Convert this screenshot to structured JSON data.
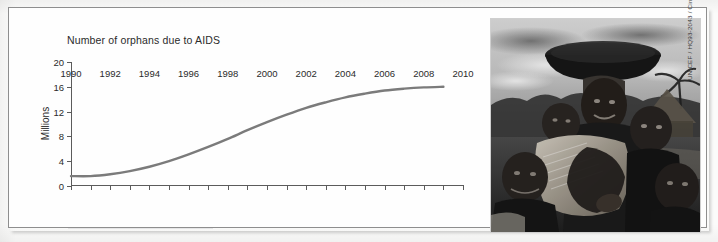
{
  "chart_data": {
    "type": "line",
    "title": "Number of orphans due to AIDS",
    "xlabel": "",
    "ylabel": "Millions",
    "xlim": [
      1990,
      2010
    ],
    "ylim": [
      0,
      20
    ],
    "grid": false,
    "legend": "none",
    "y_ticks": [
      0,
      4,
      8,
      12,
      16,
      20
    ],
    "y_tick_labels": [
      "0",
      "4",
      "8",
      "12",
      "16",
      "20"
    ],
    "x_ticks": [
      1990,
      1992,
      1994,
      1996,
      1998,
      2000,
      2002,
      2004,
      2006,
      2008,
      2010
    ],
    "x_tick_labels": [
      "1990",
      "1992",
      "1994",
      "1996",
      "1998",
      "2000",
      "2002",
      "2004",
      "2006",
      "2008",
      "2010"
    ],
    "x_minor_ticks": [
      1991,
      1993,
      1995,
      1997,
      1999,
      2001,
      2003,
      2005,
      2007,
      2009
    ],
    "series": [
      {
        "name": "Orphans due to AIDS",
        "color": "#7b7b7b",
        "x": [
          1990,
          1991,
          1992,
          1993,
          1994,
          1995,
          1996,
          1997,
          1998,
          1999,
          2000,
          2001,
          2002,
          2003,
          2004,
          2005,
          2006,
          2007,
          2008,
          2009
        ],
        "values": [
          1.6,
          1.6,
          1.9,
          2.4,
          3.1,
          4.0,
          5.1,
          6.3,
          7.6,
          9.0,
          10.3,
          11.5,
          12.6,
          13.5,
          14.3,
          14.9,
          15.4,
          15.7,
          15.9,
          16.0
        ]
      }
    ]
  },
  "photo": {
    "alt_name": "woman-with-children-photograph",
    "credit": "UNICEF / HQ93-2043 / Cindy Andrew"
  },
  "colors": {
    "line": "#7b7b7b",
    "axis": "#5b5b5b",
    "text": "#2b2b2b",
    "frame": "#8e8e8e",
    "paper": "#fefefe"
  }
}
